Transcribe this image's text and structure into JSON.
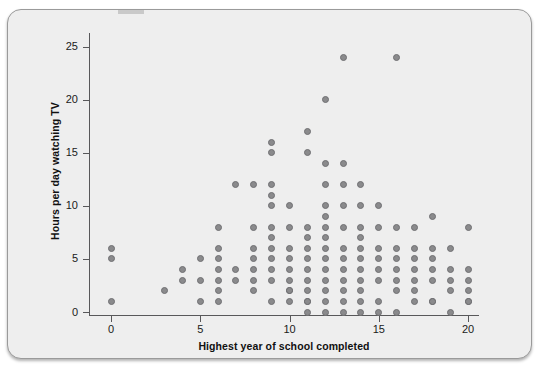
{
  "figure": {
    "background_color": "#eeeeee",
    "border_color": "#9a9a9a",
    "point_color": "#8a8a8c",
    "axis_color": "#58585a"
  },
  "chart_data": {
    "type": "scatter",
    "title": "",
    "xlabel": "Highest year of school completed",
    "ylabel": "Hours per day watching TV",
    "xlim": [
      -1.2,
      21.5
    ],
    "ylim": [
      -1.5,
      26.5
    ],
    "xticks": [
      0,
      5,
      10,
      15,
      20
    ],
    "xtick_labels": [
      "0",
      "5",
      "10",
      "15",
      "20"
    ],
    "yticks": [
      0,
      5,
      10,
      15,
      20,
      25
    ],
    "ytick_labels": [
      "0",
      "5",
      "10",
      "15",
      "20",
      "25"
    ],
    "grid": false,
    "legend": false,
    "legend_position": "none",
    "marker": "filled-circle",
    "note": "One plotted marker per distinct (x, y) pair; duplicates collapsed as in a jitter-free scatter.",
    "x": [
      0,
      0,
      0,
      3,
      4,
      4,
      5,
      5,
      5,
      6,
      6,
      6,
      6,
      6,
      6,
      6,
      7,
      7,
      7,
      8,
      8,
      8,
      8,
      8,
      8,
      8,
      9,
      9,
      9,
      9,
      9,
      9,
      9,
      9,
      9,
      9,
      9,
      9,
      10,
      10,
      10,
      10,
      10,
      10,
      10,
      10,
      10,
      11,
      11,
      11,
      11,
      11,
      11,
      11,
      11,
      11,
      11,
      11,
      11,
      12,
      12,
      12,
      12,
      12,
      12,
      12,
      12,
      12,
      12,
      12,
      12,
      12,
      12,
      13,
      13,
      13,
      13,
      13,
      13,
      13,
      13,
      13,
      13,
      13,
      13,
      14,
      14,
      14,
      14,
      14,
      14,
      14,
      14,
      14,
      14,
      14,
      15,
      15,
      15,
      15,
      15,
      15,
      15,
      15,
      16,
      16,
      16,
      16,
      16,
      16,
      16,
      16,
      17,
      17,
      17,
      17,
      17,
      17,
      17,
      18,
      18,
      18,
      18,
      18,
      18,
      18,
      19,
      19,
      19,
      19,
      19,
      20,
      20,
      20,
      20,
      20,
      20
    ],
    "y": [
      6,
      5,
      1,
      2,
      4,
      3,
      5,
      3,
      1,
      8,
      6,
      5,
      4,
      3,
      2,
      1,
      12,
      4,
      3,
      12,
      8,
      6,
      5,
      4,
      3,
      2,
      1,
      16,
      15,
      12,
      11,
      10,
      8,
      7,
      6,
      5,
      4,
      3,
      2,
      1,
      10,
      8,
      6,
      5,
      4,
      3,
      2,
      1,
      0,
      17,
      15,
      8,
      7,
      6,
      5,
      4,
      3,
      2,
      1,
      0,
      20,
      14,
      12,
      10,
      9,
      8,
      7,
      6,
      5,
      4,
      3,
      2,
      1,
      0,
      24,
      14,
      12,
      10,
      8,
      6,
      5,
      4,
      3,
      2,
      1,
      0,
      12,
      10,
      8,
      7,
      6,
      5,
      4,
      3,
      2,
      1,
      0,
      10,
      8,
      6,
      5,
      4,
      3,
      1,
      0,
      24,
      8,
      6,
      5,
      4,
      3,
      2,
      1,
      8,
      6,
      5,
      4,
      3,
      2,
      1,
      9,
      6,
      5,
      4,
      3,
      1,
      0,
      6,
      4,
      3,
      2,
      1,
      8,
      4,
      3,
      2,
      1,
      0
    ]
  }
}
